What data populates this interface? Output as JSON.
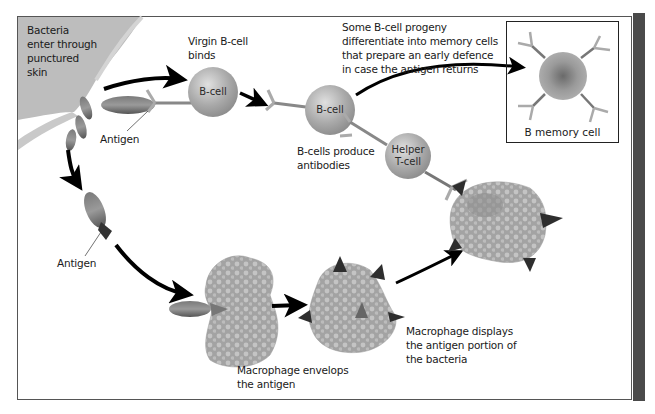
{
  "diagram": {
    "type": "immune-response-flow",
    "colors": {
      "frame_border": "#555555",
      "side_bar": "#4a4a4a",
      "skin": "#bdbdbd",
      "cell_gray": "#a8a8a8",
      "macrophage": "#9c9c9c",
      "antigen_triangle": "#2e2e2e",
      "arrow": "#000000"
    },
    "labels": {
      "bacteria_enter": "Bacteria\nenter through\npunctured\nskin",
      "antigen_top": "Antigen",
      "antigen_left": "Antigen",
      "virgin_bcell_binds": "Virgin B-cell\nbinds",
      "bcells_produce": "B-cells produce\nantibodies",
      "memory_note": "Some B-cell progeny\ndifferentiate into memory cells\nthat prepare an early defence\nin case the antigen returns",
      "macrophage_envelops": "Macrophage envelops\nthe antigen",
      "macrophage_displays": "Macrophage displays\nthe antigen portion of\nthe bacteria"
    },
    "cells": {
      "bcell_1": "B-cell",
      "bcell_2": "B-cell",
      "helper_tcell": "Helper\nT-cell",
      "memory_cell": "B memory cell"
    }
  }
}
